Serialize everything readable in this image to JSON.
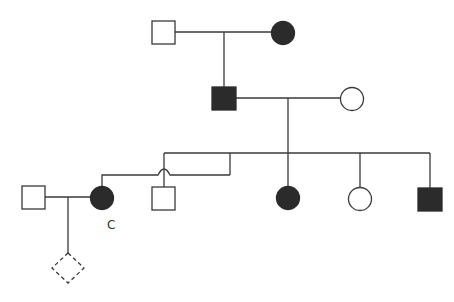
{
  "diagram": {
    "type": "pedigree",
    "colors": {
      "affected": "#2b2b2b",
      "line": "#3a3a3a",
      "background": "#ffffff"
    },
    "individuals": [
      {
        "id": "I-1",
        "sex": "male",
        "affected": false,
        "generation": 1
      },
      {
        "id": "I-2",
        "sex": "female",
        "affected": true,
        "generation": 1
      },
      {
        "id": "II-1",
        "sex": "male",
        "affected": true,
        "generation": 2
      },
      {
        "id": "II-2",
        "sex": "female",
        "affected": false,
        "generation": 2
      },
      {
        "id": "III-partner",
        "sex": "male",
        "affected": false,
        "generation": 3
      },
      {
        "id": "III-1",
        "sex": "female",
        "affected": true,
        "generation": 3,
        "label": "C"
      },
      {
        "id": "III-2",
        "sex": "male",
        "affected": false,
        "generation": 3
      },
      {
        "id": "III-3",
        "sex": "female",
        "affected": true,
        "generation": 3
      },
      {
        "id": "III-4",
        "sex": "female",
        "affected": false,
        "generation": 3
      },
      {
        "id": "III-5",
        "sex": "male",
        "affected": true,
        "generation": 3
      },
      {
        "id": "IV-1",
        "sex": "unknown",
        "affected": false,
        "generation": 4,
        "status": "pregnancy / unborn (dashed)"
      }
    ],
    "labels": {
      "consultand": "C"
    }
  }
}
